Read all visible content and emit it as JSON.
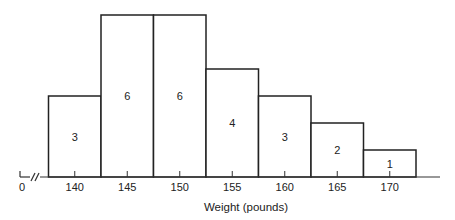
{
  "chart_data": {
    "type": "bar",
    "title": "",
    "xlabel": "Weight (pounds)",
    "ylabel": "",
    "categories": [
      "140",
      "145",
      "150",
      "155",
      "160",
      "165",
      "170"
    ],
    "values": [
      3,
      6,
      6,
      4,
      3,
      2,
      1
    ],
    "data_labels": [
      "3",
      "6",
      "6",
      "4",
      "3",
      "2",
      "1"
    ],
    "x_origin_label": "0",
    "axis_break": true,
    "grid": false,
    "legend": null
  }
}
